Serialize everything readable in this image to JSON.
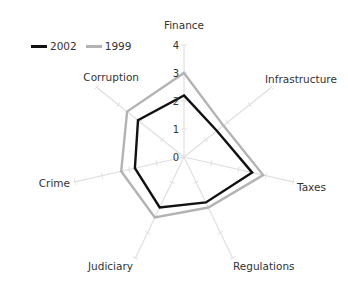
{
  "chart_data": {
    "type": "radar",
    "title": "",
    "categories": [
      "Finance",
      "Infrastructure",
      "Taxes",
      "Regulations",
      "Judiciary",
      "Crime",
      "Corruption"
    ],
    "series": [
      {
        "name": "2002",
        "color": "#111111",
        "values": [
          2.2,
          1.5,
          2.5,
          1.8,
          2.0,
          1.8,
          2.1
        ]
      },
      {
        "name": "1999",
        "color": "#b3b3b3",
        "values": [
          3.0,
          1.8,
          2.9,
          2.0,
          2.4,
          2.3,
          2.6
        ]
      }
    ],
    "radial_ticks": [
      "0",
      "1",
      "2",
      "3",
      "4"
    ],
    "rlim": [
      0,
      4
    ],
    "grid": false,
    "legend_position": "top-left"
  },
  "legend": {
    "items": [
      {
        "label": "2002",
        "color": "#111111"
      },
      {
        "label": "1999",
        "color": "#b3b3b3"
      }
    ]
  },
  "style": {
    "axis_color": "#e0e0e0",
    "background": "#ffffff"
  }
}
